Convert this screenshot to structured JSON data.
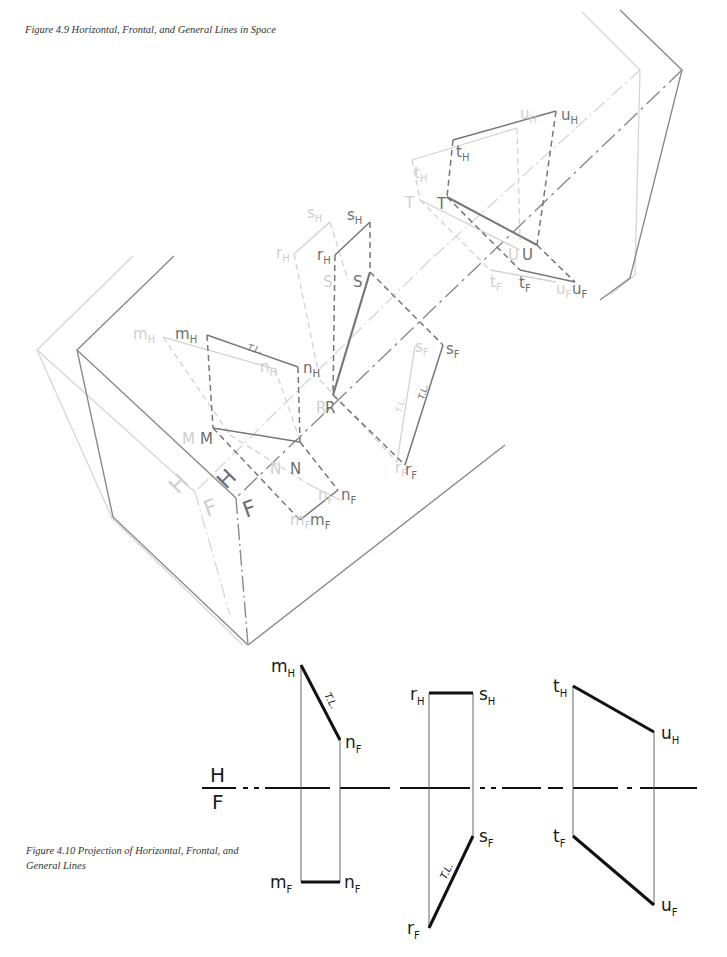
{
  "figure_4_9": {
    "caption": "Figure 4.9  Horizontal, Frontal, and General Lines in Space",
    "plane_labels": {
      "horizontal": "H",
      "frontal": "F"
    },
    "points": {
      "m_H": {
        "base": "m",
        "sub": "H"
      },
      "n_H": {
        "base": "n",
        "sub": "H"
      },
      "M": {
        "base": "M",
        "sub": ""
      },
      "N": {
        "base": "N",
        "sub": ""
      },
      "m_F": {
        "base": "m",
        "sub": "F"
      },
      "n_F": {
        "base": "n",
        "sub": "F"
      },
      "r_H": {
        "base": "r",
        "sub": "H"
      },
      "s_H": {
        "base": "s",
        "sub": "H"
      },
      "R": {
        "base": "R",
        "sub": ""
      },
      "S": {
        "base": "S",
        "sub": ""
      },
      "r_F": {
        "base": "r",
        "sub": "F"
      },
      "s_F": {
        "base": "s",
        "sub": "F"
      },
      "t_H": {
        "base": "t",
        "sub": "H"
      },
      "u_H": {
        "base": "u",
        "sub": "H"
      },
      "T": {
        "base": "T",
        "sub": ""
      },
      "U": {
        "base": "U",
        "sub": ""
      },
      "t_F": {
        "base": "t",
        "sub": "F"
      },
      "u_F": {
        "base": "u",
        "sub": "F"
      }
    },
    "true_length_mark": "T.L."
  },
  "figure_4_10": {
    "caption": "Figure 4.10  Projection of Horizontal, Frontal, and General Lines",
    "fold_line": {
      "top": "H",
      "bottom": "F"
    },
    "true_length_mark": "T.L.",
    "horizontal_line": {
      "top_left": {
        "base": "m",
        "sub": "H"
      },
      "top_right": {
        "base": "n",
        "sub": "F"
      },
      "bottom_left": {
        "base": "m",
        "sub": "F"
      },
      "bottom_right": {
        "base": "n",
        "sub": "F"
      }
    },
    "frontal_line": {
      "top_left": {
        "base": "r",
        "sub": "H"
      },
      "top_right": {
        "base": "s",
        "sub": "H"
      },
      "bottom_left": {
        "base": "r",
        "sub": "F"
      },
      "bottom_right": {
        "base": "s",
        "sub": "F"
      }
    },
    "general_line": {
      "top_left": {
        "base": "t",
        "sub": "H"
      },
      "top_right": {
        "base": "u",
        "sub": "H"
      },
      "bottom_left": {
        "base": "t",
        "sub": "F"
      },
      "bottom_right": {
        "base": "u",
        "sub": "F"
      }
    }
  }
}
